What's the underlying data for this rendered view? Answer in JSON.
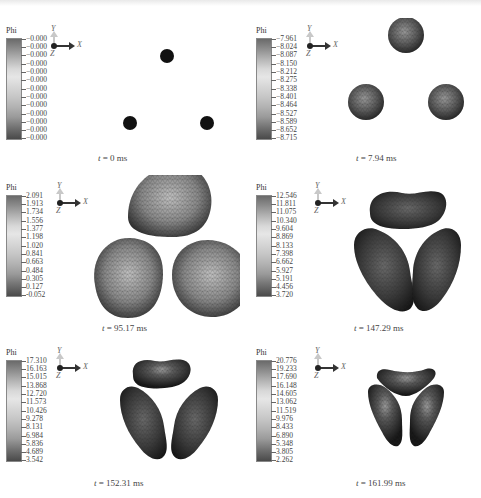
{
  "figure": {
    "quantity_label": "Phi",
    "axes": {
      "x": "X",
      "y": "Y",
      "z": "Z"
    },
    "panels": [
      {
        "caption_var": "t",
        "caption_value": " = 0 ms",
        "legend": [
          "−0.000",
          "−0.000",
          "−0.000",
          "−0.000",
          "−0.000",
          "−0.000",
          "−0.000",
          "−0.000",
          "−0.000",
          "−0.000",
          "−0.000",
          "−0.000",
          "−0.000"
        ]
      },
      {
        "caption_var": "t",
        "caption_value": " = 7.94 ms",
        "legend": [
          "−7.961",
          "−8.024",
          "−8.087",
          "−8.150",
          "−8.212",
          "−8.275",
          "−8.338",
          "−8.401",
          "−8.464",
          "−8.527",
          "−8.589",
          "−8.652",
          "−8.715"
        ]
      },
      {
        "caption_var": "t",
        "caption_value": " = 95.17 ms",
        "legend": [
          "2.091",
          "1.913",
          "1.734",
          "1.556",
          "1.377",
          "1.198",
          "1.020",
          "0.841",
          "0.663",
          "0.484",
          "0.305",
          "0.127",
          "-0.052"
        ]
      },
      {
        "caption_var": "t",
        "caption_value": " = 147.29 ms",
        "legend": [
          "12.546",
          "11.811",
          "11.075",
          "10.340",
          "9.604",
          "8.869",
          "8.133",
          "7.398",
          "6.662",
          "5.927",
          "5.191",
          "4.456",
          "3.720"
        ]
      },
      {
        "caption_var": "t",
        "caption_value": " = 152.31 ms",
        "legend": [
          "17.310",
          "16.163",
          "15.015",
          "13.868",
          "12.720",
          "11.573",
          "10.426",
          "9.278",
          "8.131",
          "6.984",
          "5.836",
          "4.689",
          "3.542"
        ]
      },
      {
        "caption_var": "t",
        "caption_value": " = 161.99 ms",
        "legend": [
          "20.776",
          "19.233",
          "17.690",
          "16.148",
          "14.605",
          "13.062",
          "11.519",
          "9.976",
          "8.433",
          "6.890",
          "5.348",
          "3.805",
          "2.262"
        ]
      }
    ]
  }
}
